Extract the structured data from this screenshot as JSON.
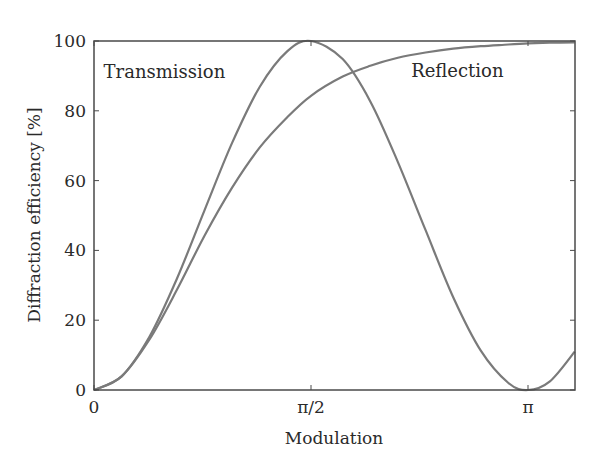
{
  "chart_data": {
    "type": "line",
    "title": "",
    "xlabel": "Modulation",
    "ylabel": "Diffraction efficiency [%]",
    "xlim": [
      0,
      3.48
    ],
    "ylim": [
      0,
      100
    ],
    "grid": false,
    "legend_position": "inline labels",
    "x_ticks": [
      {
        "value": 0,
        "label": "0"
      },
      {
        "value": 1.5708,
        "label": "π/2"
      },
      {
        "value": 3.1416,
        "label": "π"
      }
    ],
    "y_ticks": [
      {
        "value": 0,
        "label": "0"
      },
      {
        "value": 20,
        "label": "20"
      },
      {
        "value": 40,
        "label": "40"
      },
      {
        "value": 60,
        "label": "60"
      },
      {
        "value": 80,
        "label": "80"
      },
      {
        "value": 100,
        "label": "100"
      }
    ],
    "x": [
      0,
      0.2,
      0.4,
      0.6,
      0.8,
      1.0,
      1.2,
      1.4,
      1.5708,
      1.8,
      2.0,
      2.2,
      2.4,
      2.6,
      2.8,
      3.0,
      3.1416,
      3.3,
      3.48
    ],
    "series": [
      {
        "name": "Transmission",
        "label": "Transmission",
        "color": "#7a7a7a",
        "values": [
          0,
          3.9,
          15.2,
          31.9,
          51.5,
          70.8,
          86.9,
          97.1,
          100,
          94.8,
          82.7,
          65.3,
          45.8,
          26.6,
          11.3,
          2.0,
          0,
          2.5,
          11.0
        ]
      },
      {
        "name": "Reflection",
        "label": "Reflection",
        "color": "#7a7a7a",
        "values": [
          0,
          3.9,
          14.4,
          28.7,
          44.2,
          58.0,
          69.5,
          78.2,
          84.3,
          89.8,
          92.9,
          95.2,
          96.7,
          97.8,
          98.5,
          99.0,
          99.3,
          99.5,
          99.6
        ]
      }
    ],
    "annotations": [
      {
        "text": "Transmission",
        "x": 0.51,
        "y": 91
      },
      {
        "text": "Reflection",
        "x": 2.63,
        "y": 91.5
      }
    ],
    "colors": {
      "frame": "#4a4a4a",
      "curve": "#7a7a7a",
      "text": "#2a2a2a"
    }
  }
}
